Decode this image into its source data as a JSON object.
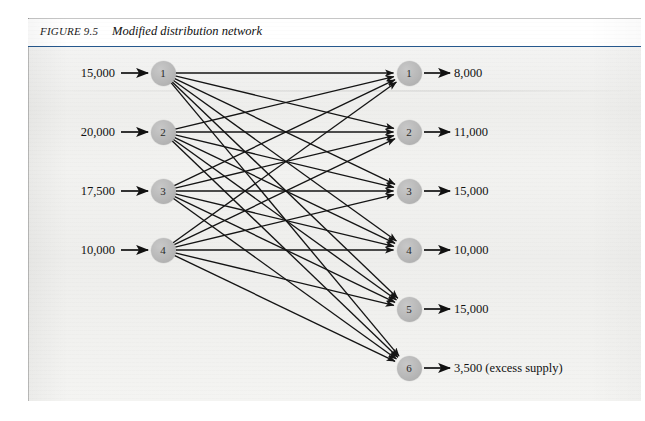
{
  "figure": {
    "label": "FIGURE 9.5",
    "title": "Modified distribution network"
  },
  "chart_data": {
    "type": "diagram",
    "diagram_type": "bipartite-transportation-network",
    "title": "Modified distribution network",
    "title_label": "FIGURE 9.5",
    "supply_nodes": [
      {
        "id": "1",
        "supply": "15,000"
      },
      {
        "id": "2",
        "supply": "20,000"
      },
      {
        "id": "3",
        "supply": "17,500"
      },
      {
        "id": "4",
        "supply": "10,000"
      }
    ],
    "demand_nodes": [
      {
        "id": "1",
        "demand": "8,000"
      },
      {
        "id": "2",
        "demand": "11,000"
      },
      {
        "id": "3",
        "demand": "15,000"
      },
      {
        "id": "4",
        "demand": "10,000"
      },
      {
        "id": "5",
        "demand": "15,000"
      },
      {
        "id": "6",
        "demand": "3,500 (excess supply)"
      }
    ],
    "edges": "complete bipartite: every supply node connects by a directed arc to every demand node (4 x 6 = 24 arcs)",
    "edge_count": 24,
    "node_fill": "#b5b5b5",
    "arc_color": "#1a1a1a",
    "total_supply": "62,500",
    "total_demand": "62,500"
  },
  "supply": [
    {
      "value": "15,000",
      "node": "1"
    },
    {
      "value": "20,000",
      "node": "2"
    },
    {
      "value": "17,500",
      "node": "3"
    },
    {
      "value": "10,000",
      "node": "4"
    }
  ],
  "demand": [
    {
      "node": "1",
      "value": "8,000"
    },
    {
      "node": "2",
      "value": "11,000"
    },
    {
      "node": "3",
      "value": "15,000"
    },
    {
      "node": "4",
      "value": "10,000"
    },
    {
      "node": "5",
      "value": "15,000"
    },
    {
      "node": "6",
      "value": "3,500 (excess supply)"
    }
  ]
}
